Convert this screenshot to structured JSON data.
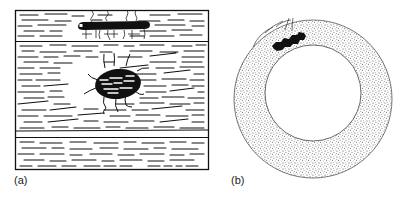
{
  "panels": [
    {
      "id": "a",
      "label": "(a)",
      "description": "Cross-section of layered sedimentary rock with a flat elongated burrow/organism at the top layer and an oval dark body with radiating tendrils in the middle layer"
    },
    {
      "id": "b",
      "label": "(b)",
      "description": "Stippled ring (annulus) cross-section with a dark irregular lesion at upper-left and fine radial lines"
    }
  ],
  "colors": {
    "ink": "#111111",
    "stipple": "#555555",
    "background": "#ffffff"
  }
}
